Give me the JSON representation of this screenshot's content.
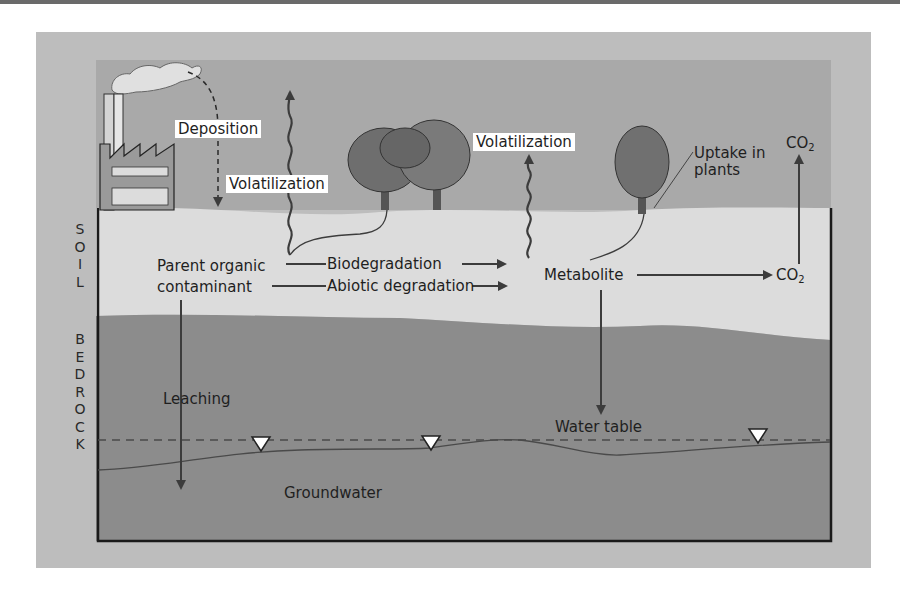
{
  "diagram": {
    "side_labels": {
      "soil": [
        "S",
        "O",
        "I",
        "L"
      ],
      "bedrock": [
        "B",
        "E",
        "D",
        "R",
        "O",
        "C",
        "K"
      ]
    },
    "labels": {
      "deposition": "Deposition",
      "volatilization_1": "Volatilization",
      "volatilization_2": "Volatilization",
      "uptake_line1": "Uptake in",
      "uptake_line2": "plants",
      "co2_top": "CO",
      "co2_top_sub": "2",
      "parent_line1": "Parent organic",
      "parent_line2": "contaminant",
      "biodegradation": "Biodegradation",
      "abiotic": "Abiotic degradation",
      "metabolite": "Metabolite",
      "co2_right": "CO",
      "co2_right_sub": "2",
      "leaching": "Leaching",
      "water_table": "Water table",
      "groundwater": "Groundwater"
    },
    "layers": [
      "air",
      "soil",
      "bedrock",
      "groundwater"
    ],
    "icons": [
      "factory-icon",
      "smoke-plume-icon",
      "tree-icon",
      "water-table-marker-icon"
    ],
    "colors": {
      "panel": "#bdbdbd",
      "air": "#a9a9a9",
      "soil": "#dcdcdc",
      "bedrock": "#8a8a8a",
      "arrows": "#3c3c3c"
    }
  }
}
